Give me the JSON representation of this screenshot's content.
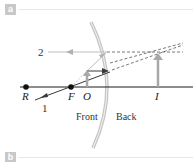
{
  "panels": [
    {
      "id": "a",
      "label": "a"
    },
    {
      "id": "b",
      "label": "b"
    }
  ],
  "diagram": {
    "type": "convex-mirror-ray-diagram",
    "points": {
      "R": "R",
      "F": "F",
      "O": "O",
      "I": "I"
    },
    "rays": {
      "ray1": "1",
      "ray2": "2"
    },
    "sides": {
      "front": "Front",
      "back": "Back"
    },
    "colors": {
      "axis": "#1a1a1a",
      "ray": "#3a3a3a",
      "light_ray": "#bdbdbd",
      "arrow_object": "#a8a8a8",
      "mirror": "#c4c4c4",
      "panel_label_bg": "#c8c8c8"
    }
  }
}
